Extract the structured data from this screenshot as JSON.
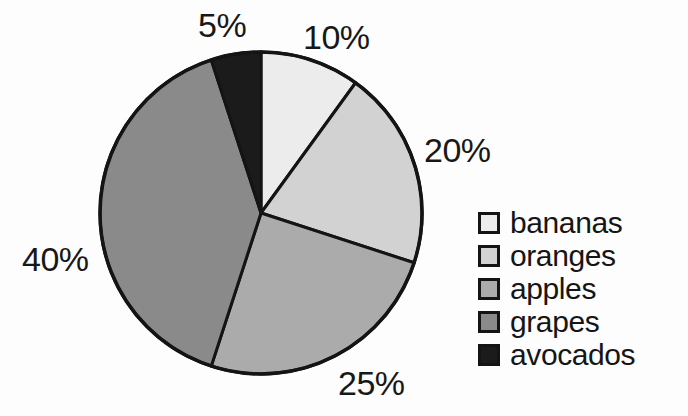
{
  "chart_data": {
    "type": "pie",
    "title": "",
    "categories": [
      "bananas",
      "oranges",
      "apples",
      "grapes",
      "avocados"
    ],
    "values": [
      10,
      20,
      25,
      40,
      5
    ],
    "value_labels": [
      "10%",
      "20%",
      "25%",
      "40%",
      "5%"
    ],
    "units": "percent",
    "total": 100,
    "start_angle_deg": 0,
    "direction": "clockwise",
    "legend_position": "right",
    "grid": false,
    "xlabel": "",
    "ylabel": "",
    "slice_colors": [
      "#ececec",
      "#d2d2d2",
      "#ababab",
      "#8a8a8a",
      "#1b1b1b"
    ],
    "outline_color": "#141414",
    "background_color": "#fdfdfd",
    "slices": [
      {
        "label": "bananas",
        "value": 10,
        "value_label": "10%",
        "color": "#ececec",
        "start_deg": 0,
        "end_deg": 36
      },
      {
        "label": "oranges",
        "value": 20,
        "value_label": "20%",
        "color": "#d2d2d2",
        "start_deg": 36,
        "end_deg": 108
      },
      {
        "label": "apples",
        "value": 25,
        "value_label": "25%",
        "color": "#ababab",
        "start_deg": 108,
        "end_deg": 198
      },
      {
        "label": "grapes",
        "value": 40,
        "value_label": "40%",
        "color": "#8a8a8a",
        "start_deg": 198,
        "end_deg": 342
      },
      {
        "label": "avocados",
        "value": 5,
        "value_label": "5%",
        "color": "#1b1b1b",
        "start_deg": 342,
        "end_deg": 360
      }
    ]
  },
  "labels": {
    "bananas_pct": "10%",
    "oranges_pct": "20%",
    "apples_pct": "25%",
    "grapes_pct": "40%",
    "avocados_pct": "5%"
  },
  "legend": {
    "items": [
      {
        "label": "bananas",
        "color": "#ececec"
      },
      {
        "label": "oranges",
        "color": "#d2d2d2"
      },
      {
        "label": "apples",
        "color": "#ababab"
      },
      {
        "label": "grapes",
        "color": "#8a8a8a"
      },
      {
        "label": "avocados",
        "color": "#1b1b1b"
      }
    ]
  }
}
